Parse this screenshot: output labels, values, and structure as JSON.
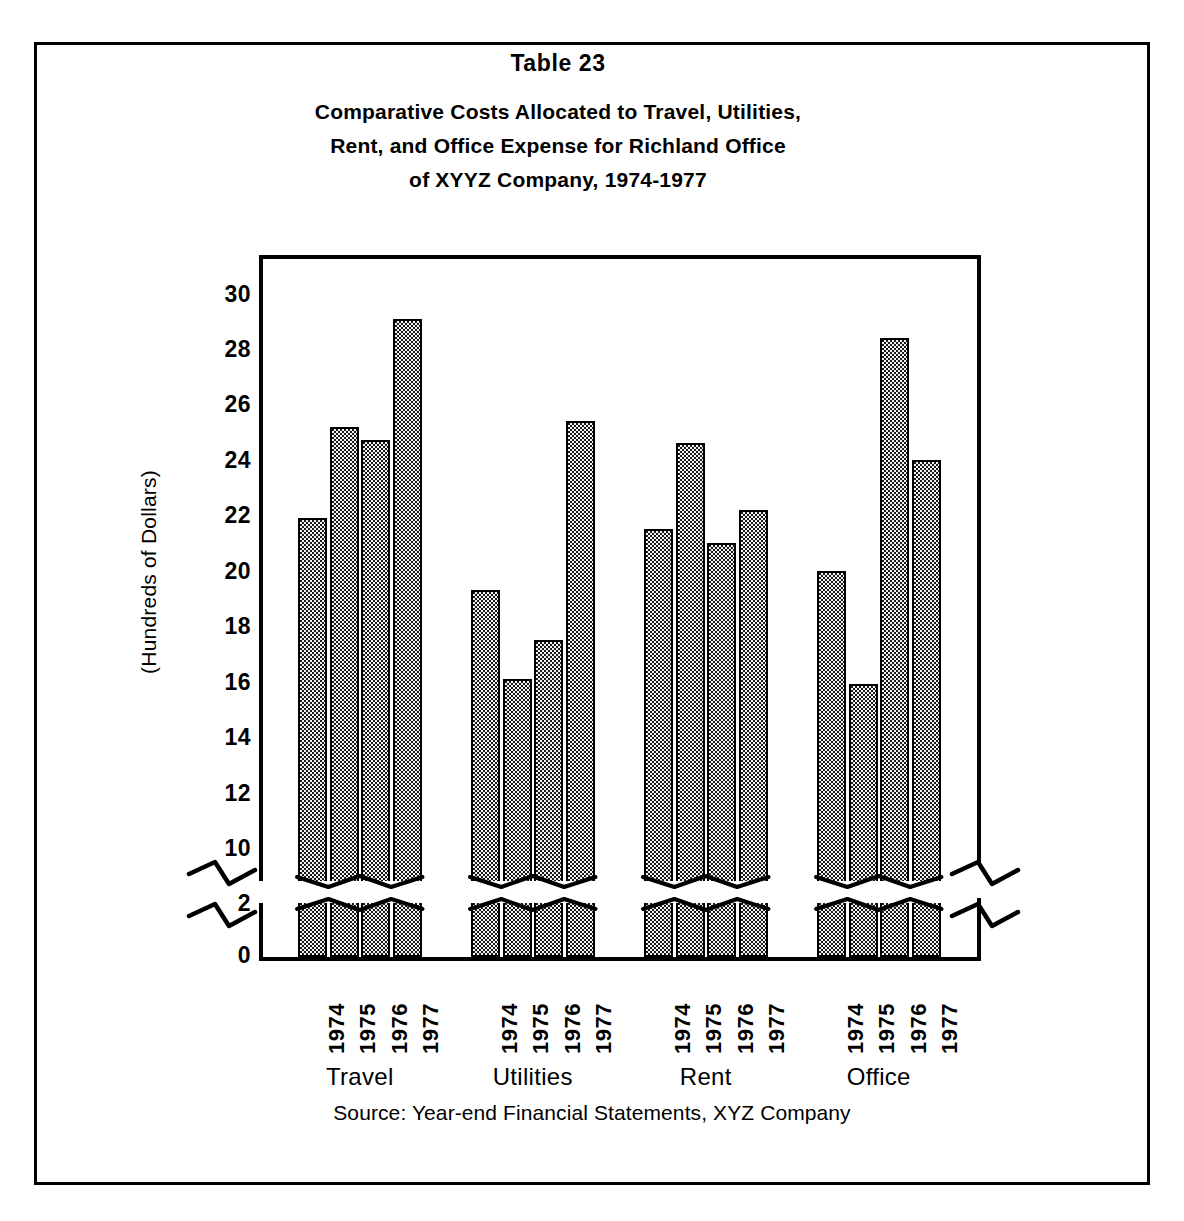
{
  "figure": {
    "table_number": "Table  23",
    "title_lines": [
      "Comparative Costs Allocated to Travel, Utilities,",
      "Rent, and Office Expense for Richland Office",
      "of XYYZ Company, 1974-1977"
    ],
    "source_note": "Source:  Year-end Financial Statements, XYZ Company",
    "ink_color": "#000000",
    "bar_fill_color": "#f2f2f2",
    "background_color": "#ffffff"
  },
  "chart_data": {
    "type": "bar",
    "title": "Comparative Costs Allocated to Travel, Utilities, Rent, and Office Expense for Richland Office of XYYZ Company, 1974-1977",
    "subtitle": "Table  23",
    "xlabel": "",
    "ylabel": "(Hundreds of Dollars)",
    "ylim": [
      0,
      31
    ],
    "grid": false,
    "legend": "none",
    "axis_break": {
      "present": true,
      "lower_segment": [
        0,
        2
      ],
      "upper_segment": [
        10,
        30
      ],
      "note": "Y axis is broken between 2 and 10; bars are drawn as an upper column plus a short stub below the break."
    },
    "y_ticks": [
      30,
      28,
      26,
      24,
      22,
      20,
      18,
      16,
      14,
      12,
      10,
      2,
      0
    ],
    "categories": [
      "Travel",
      "Utilities",
      "Rent",
      "Office"
    ],
    "x": [
      "1974",
      "1975",
      "1976",
      "1977"
    ],
    "series": [
      {
        "name": "1974",
        "values": [
          21.9,
          19.3,
          21.5,
          20.0
        ]
      },
      {
        "name": "1975",
        "values": [
          25.2,
          16.1,
          24.6,
          15.9
        ]
      },
      {
        "name": "1976",
        "values": [
          24.7,
          17.5,
          21.0,
          28.4
        ]
      },
      {
        "name": "1977",
        "values": [
          29.1,
          25.4,
          22.2,
          24.0
        ]
      }
    ],
    "groups": [
      {
        "label": "Travel",
        "bars": [
          {
            "year": "1974",
            "value": 21.9
          },
          {
            "year": "1975",
            "value": 25.2
          },
          {
            "year": "1976",
            "value": 24.7
          },
          {
            "year": "1977",
            "value": 29.1
          }
        ]
      },
      {
        "label": "Utilities",
        "bars": [
          {
            "year": "1974",
            "value": 19.3
          },
          {
            "year": "1975",
            "value": 16.1
          },
          {
            "year": "1976",
            "value": 17.5
          },
          {
            "year": "1977",
            "value": 25.4
          }
        ]
      },
      {
        "label": "Rent",
        "bars": [
          {
            "year": "1974",
            "value": 21.5
          },
          {
            "year": "1975",
            "value": 24.6
          },
          {
            "year": "1976",
            "value": 21.0
          },
          {
            "year": "1977",
            "value": 22.2
          }
        ]
      },
      {
        "label": "Office",
        "bars": [
          {
            "year": "1974",
            "value": 20.0
          },
          {
            "year": "1975",
            "value": 15.9
          },
          {
            "year": "1976",
            "value": 28.4
          },
          {
            "year": "1977",
            "value": 24.0
          }
        ]
      }
    ]
  }
}
